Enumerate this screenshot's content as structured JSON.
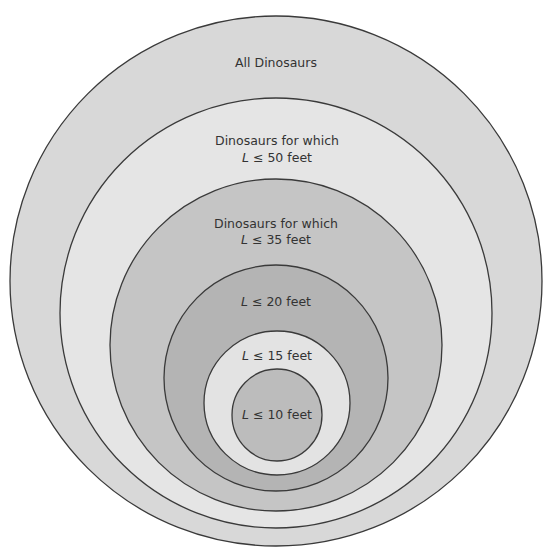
{
  "diagram": {
    "type": "nested-set-venn",
    "stroke_color": "#3a3a3a",
    "sets": [
      {
        "id": "all",
        "line1": "All Dinosaurs",
        "line2": "",
        "fill": "#d8d8d8",
        "cx": 276,
        "cy": 281,
        "rx": 266,
        "ry": 265
      },
      {
        "id": "le50",
        "line1": "Dinosaurs for which",
        "line2_var": "L",
        "line2_rest": " ≤ 50 feet",
        "fill": "#e5e5e5",
        "cx": 276,
        "cy": 313,
        "rx": 216,
        "ry": 215
      },
      {
        "id": "le35",
        "line1": "Dinosaurs for which",
        "line2_var": "L",
        "line2_rest": " ≤ 35 feet",
        "fill": "#c5c5c5",
        "cx": 276,
        "cy": 345,
        "rx": 166,
        "ry": 166
      },
      {
        "id": "le20",
        "line1_var": "L",
        "line1_rest": " ≤ 20 feet",
        "fill": "#b4b4b4",
        "cx": 276,
        "cy": 378,
        "rx": 112,
        "ry": 113
      },
      {
        "id": "le15",
        "line1_var": "L",
        "line1_rest": " ≤ 15 feet",
        "fill": "#e3e3e3",
        "cx": 277,
        "cy": 403,
        "rx": 73,
        "ry": 72
      },
      {
        "id": "le10",
        "line1_var": "L",
        "line1_rest": " ≤ 10 feet",
        "fill": "#bcbcbc",
        "cx": 277,
        "cy": 415,
        "rx": 45,
        "ry": 46
      }
    ]
  }
}
